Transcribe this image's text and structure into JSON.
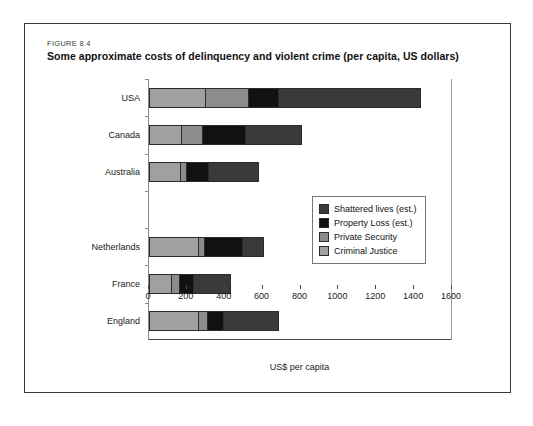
{
  "figure": {
    "number": "FIGURE 8.4",
    "title": "Some approximate costs of delinquency and violent crime (per capita, US dollars)"
  },
  "chart_data": {
    "type": "bar",
    "orientation": "horizontal",
    "stacked": true,
    "title": "Some approximate costs of delinquency and violent crime (per capita, US dollars)",
    "xlabel": "US$ per capita",
    "ylabel": "",
    "xlim": [
      0,
      1600
    ],
    "xticks": [
      0,
      200,
      400,
      600,
      800,
      1000,
      1200,
      1400,
      1600
    ],
    "grid": false,
    "legend_position": "center-right",
    "categories": [
      "USA",
      "Canada",
      "Australia",
      "",
      "Netherlands",
      "France",
      "England"
    ],
    "series": [
      {
        "name": "Criminal Justice",
        "color": "#a0a0a0",
        "values": [
          290,
          165,
          160,
          0,
          255,
          110,
          255
        ]
      },
      {
        "name": "Private Security",
        "color": "#8c8c8c",
        "values": [
          220,
          105,
          25,
          0,
          25,
          40,
          40
        ]
      },
      {
        "name": "Property Loss (est.)",
        "color": "#111111",
        "values": [
          155,
          220,
          110,
          0,
          195,
          67,
          80
        ]
      },
      {
        "name": "Shattered lives (est.)",
        "color": "#3a3a3a",
        "values": [
          745,
          290,
          260,
          0,
          105,
          191,
          285
        ]
      }
    ],
    "totals": [
      1410,
      780,
      555,
      0,
      580,
      408,
      660
    ]
  },
  "legend": {
    "items": [
      {
        "label": "Shattered lives (est.)",
        "color": "#3a3a3a"
      },
      {
        "label": "Property Loss (est.)",
        "color": "#111111"
      },
      {
        "label": "Private Security",
        "color": "#8c8c8c"
      },
      {
        "label": "Criminal Justice",
        "color": "#a0a0a0"
      }
    ]
  },
  "axis": {
    "x_title": "US$ per capita"
  }
}
